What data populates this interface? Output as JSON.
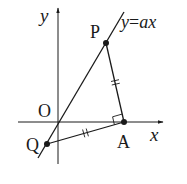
{
  "diagram": {
    "type": "coordinate-geometry",
    "colors": {
      "stroke": "#1a1a1a",
      "background": "#ffffff"
    },
    "axes": {
      "x_label": "x",
      "y_label": "y",
      "origin_label": "O"
    },
    "line": {
      "equation_label": "y=ax",
      "equation_lhs": "y",
      "equation_eq": "=",
      "equation_rhs": "ax"
    },
    "points": [
      {
        "name": "P",
        "label": "P",
        "on": "line y=ax"
      },
      {
        "name": "A",
        "label": "A",
        "on": "x-axis"
      },
      {
        "name": "Q",
        "label": "Q",
        "on": "line y=ax"
      }
    ],
    "segments": [
      {
        "from": "P",
        "to": "A",
        "tick_marks": 2
      },
      {
        "from": "Q",
        "to": "A",
        "tick_marks": 2
      }
    ],
    "annotations": {
      "right_angle_at": "A",
      "right_angle_between": [
        "AP",
        "AQ"
      ],
      "equal_lengths": [
        "PA",
        "QA"
      ]
    }
  }
}
